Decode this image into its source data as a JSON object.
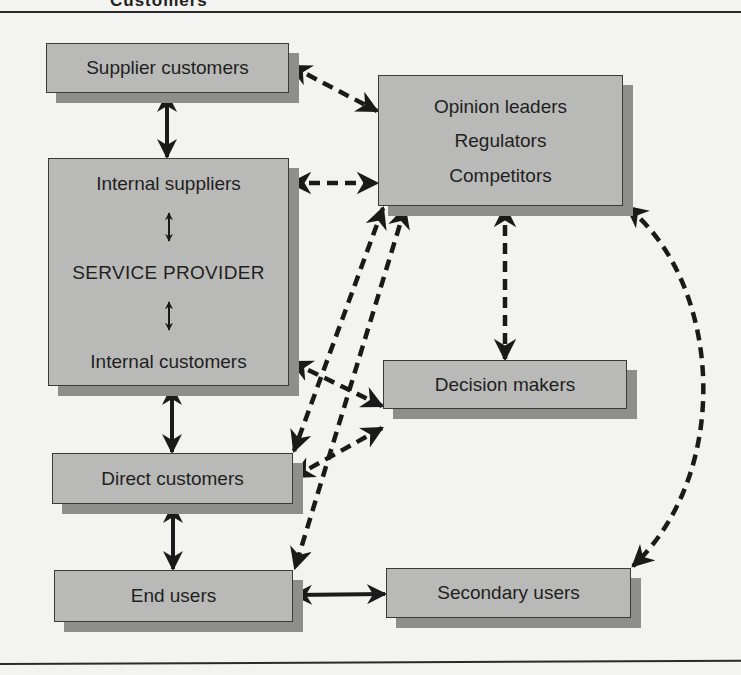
{
  "page": {
    "header_fragment": "Customers",
    "top_rule": true,
    "bottom_rule": true
  },
  "nodes": {
    "supplier_customers": {
      "label": "Supplier customers"
    },
    "external": {
      "lines": [
        "Opinion leaders",
        "Regulators",
        "Competitors"
      ]
    },
    "service_provider": {
      "top": "Internal suppliers",
      "center": "SERVICE PROVIDER",
      "bottom": "Internal customers"
    },
    "decision_makers": {
      "label": "Decision makers"
    },
    "direct_customers": {
      "label": "Direct customers"
    },
    "end_users": {
      "label": "End users"
    },
    "secondary_users": {
      "label": "Secondary users"
    }
  },
  "connections": [
    {
      "from": "Supplier customers",
      "to": "Service provider (Internal suppliers)",
      "style": "solid",
      "direction": "both"
    },
    {
      "from": "Supplier customers",
      "to": "Opinion leaders / Regulators / Competitors",
      "style": "dashed",
      "direction": "both"
    },
    {
      "from": "Internal suppliers",
      "to": "Opinion leaders / Regulators / Competitors",
      "style": "dashed",
      "direction": "both"
    },
    {
      "from": "Internal suppliers",
      "to": "SERVICE PROVIDER",
      "style": "solid",
      "direction": "both"
    },
    {
      "from": "SERVICE PROVIDER",
      "to": "Internal customers",
      "style": "solid",
      "direction": "both"
    },
    {
      "from": "Internal customers",
      "to": "Decision makers",
      "style": "dashed",
      "direction": "both"
    },
    {
      "from": "Service provider",
      "to": "Direct customers",
      "style": "solid",
      "direction": "both"
    },
    {
      "from": "Opinion leaders / Regulators / Competitors",
      "to": "Decision makers",
      "style": "dashed",
      "direction": "both"
    },
    {
      "from": "Opinion leaders / Regulators / Competitors",
      "to": "Direct customers",
      "style": "dashed",
      "direction": "both"
    },
    {
      "from": "Opinion leaders / Regulators / Competitors",
      "to": "End users",
      "style": "dashed",
      "direction": "both"
    },
    {
      "from": "Decision makers",
      "to": "Direct customers",
      "style": "dashed",
      "direction": "both"
    },
    {
      "from": "Direct customers",
      "to": "End users",
      "style": "solid",
      "direction": "both"
    },
    {
      "from": "End users",
      "to": "Secondary users",
      "style": "solid",
      "direction": "both"
    },
    {
      "from": "Opinion leaders / Regulators / Competitors",
      "to": "Secondary users",
      "style": "dashed-curve",
      "direction": "both"
    }
  ],
  "colors": {
    "background": "#f3f3f1",
    "box_fill": "#b9b9b7",
    "box_shadow": "#8e8e8c",
    "box_border": "#3a3a3a",
    "arrow": "#1a1a1a",
    "text": "#1f1f1f"
  }
}
